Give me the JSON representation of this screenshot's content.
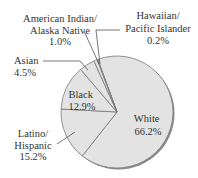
{
  "chart_data": {
    "type": "pie",
    "title": "",
    "slices": [
      {
        "label": "White",
        "value": 66.2,
        "display": "66.2%"
      },
      {
        "label": "Latino/ Hispanic",
        "value": 15.2,
        "display": "15.2%"
      },
      {
        "label": "Black",
        "value": 12.9,
        "display": "12.9%"
      },
      {
        "label": "Asian",
        "value": 4.5,
        "display": "4.5%"
      },
      {
        "label": "American Indian/ Alaska Native",
        "value": 1.0,
        "display": "1.0%"
      },
      {
        "label": "Hawaiian/ Pacific Islander",
        "value": 0.2,
        "display": "0.2%"
      }
    ],
    "colors": {
      "fill": "#e3e3e3",
      "edge": "#7a7a7a",
      "shadow": "#8a8a8a",
      "text": "#333333"
    }
  },
  "labels": {
    "white": {
      "line1": "White",
      "value": "66.2%"
    },
    "latino": {
      "line1": "Latino/",
      "line2": "Hispanic",
      "value": "15.2%"
    },
    "black": {
      "line1": "Black",
      "value": "12.9%"
    },
    "asian": {
      "line1": "Asian",
      "value": "4.5%"
    },
    "amind": {
      "line1": "American Indian/",
      "line2": "Alaska Native",
      "value": "1.0%"
    },
    "hawaiian": {
      "line1": "Hawaiian/",
      "line2": "Pacific Islander",
      "value": "0.2%"
    }
  }
}
